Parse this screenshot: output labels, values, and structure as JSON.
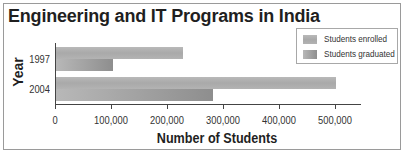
{
  "chart_data": {
    "type": "bar",
    "orientation": "horizontal",
    "title": "Engineering and IT Programs in India",
    "xlabel": "Number of Students",
    "ylabel": "Year",
    "categories": [
      "1997",
      "2004"
    ],
    "series": [
      {
        "name": "Students enrolled",
        "values": [
          227000,
          500000
        ],
        "color": "#b3b3b3"
      },
      {
        "name": "Students graduated",
        "values": [
          101000,
          280000
        ],
        "color": "#9a9a9a"
      }
    ],
    "xlim": [
      0,
      500000
    ],
    "xticks": [
      0,
      100000,
      200000,
      300000,
      400000,
      500000
    ],
    "xtick_labels": [
      "0",
      "100,000",
      "200,000",
      "300,000",
      "400,000",
      "500,000"
    ],
    "grid": false,
    "legend_position": "upper right"
  },
  "legend": {
    "items": [
      {
        "label": "Students enrolled"
      },
      {
        "label": "Students graduated"
      }
    ]
  }
}
